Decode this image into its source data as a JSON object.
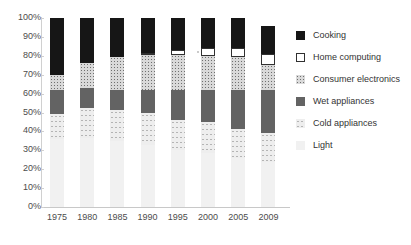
{
  "chart_data": {
    "type": "bar",
    "stacked": true,
    "stack_mode": "percent",
    "title": "",
    "xlabel": "",
    "ylabel": "",
    "categories": [
      "1975",
      "1980",
      "1985",
      "1990",
      "1995",
      "2000",
      "2005",
      "2009"
    ],
    "ylim": [
      0,
      100
    ],
    "ytick_labels": [
      "0%",
      "10%",
      "20%",
      "30%",
      "40%",
      "50%",
      "60%",
      "70%",
      "80%",
      "90%",
      "100%"
    ],
    "ytick_values": [
      0,
      10,
      20,
      30,
      40,
      50,
      60,
      70,
      80,
      90,
      100
    ],
    "grid": false,
    "legend_position": "right",
    "stack_order_bottom_to_top": [
      "Light",
      "Cold appliances",
      "Wet appliances",
      "Consumer electronics",
      "Home computing",
      "Cooking"
    ],
    "series": [
      {
        "name": "Light",
        "key": "light",
        "color": "#f1f1f1",
        "values": [
          36,
          36.5,
          35,
          33,
          30,
          28.5,
          26,
          24
        ]
      },
      {
        "name": "Cold appliances",
        "key": "coldappliances",
        "color": "#eeeeee",
        "values": [
          13,
          16,
          16.5,
          16.5,
          16,
          16.5,
          15.5,
          15
        ]
      },
      {
        "name": "Wet appliances",
        "key": "wetappliances",
        "color": "#636363",
        "values": [
          13,
          10.5,
          10.5,
          12.5,
          16,
          17,
          20.5,
          23
        ]
      },
      {
        "name": "Consumer electronics",
        "key": "consumerelectronics",
        "color": "#d9d9d9",
        "values": [
          8,
          13,
          17.5,
          18.5,
          18.5,
          18,
          17.5,
          13
        ]
      },
      {
        "name": "Home computing",
        "key": "homecomputing",
        "color": "#ffffff",
        "values": [
          0,
          0,
          0,
          1,
          2.5,
          4,
          4.5,
          6
        ]
      },
      {
        "name": "Cooking",
        "key": "cooking",
        "color": "#161616",
        "values": [
          30,
          24,
          20.5,
          18.5,
          17,
          16,
          16,
          15
        ]
      }
    ],
    "legend_entries": [
      {
        "label": "Cooking",
        "key": "cooking"
      },
      {
        "label": "Home computing",
        "key": "homecomputing"
      },
      {
        "label": "Consumer electronics",
        "key": "consumerelectronics"
      },
      {
        "label": "Wet appliances",
        "key": "wetappliances"
      },
      {
        "label": "Cold appliances",
        "key": "coldappliances"
      },
      {
        "label": "Light",
        "key": "light"
      }
    ]
  }
}
